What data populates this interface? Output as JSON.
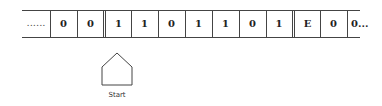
{
  "tape": {
    "left_ellipsis": "......",
    "cells": [
      "0",
      "0",
      "1",
      "1",
      "0",
      "1",
      "1",
      "0",
      "1",
      "E",
      "0",
      "0..."
    ]
  },
  "head": {
    "label": "Start",
    "icon": "pentagon-head-pointer"
  }
}
